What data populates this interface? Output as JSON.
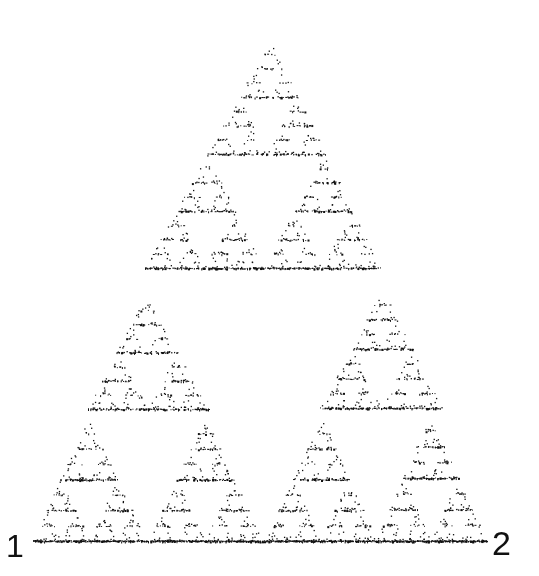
{
  "figure": {
    "type": "sierpinski-dot-fractal",
    "background": "#ffffff",
    "dot_color": "#111111",
    "labels": {
      "left_corner": "1",
      "right_corner": "2"
    },
    "triangles": [
      {
        "name": "top",
        "apex": [
          270,
          40
        ],
        "base_left": [
          145,
          268
        ],
        "base_right": [
          380,
          268
        ],
        "levels": 4,
        "density": 0.55
      },
      {
        "name": "middle-left",
        "apex": [
          145,
          296
        ],
        "base_left": [
          88,
          409
        ],
        "base_right": [
          208,
          409
        ],
        "levels": 3,
        "density": 0.6
      },
      {
        "name": "middle-right",
        "apex": [
          382,
          290
        ],
        "base_left": [
          320,
          408
        ],
        "base_right": [
          442,
          408
        ],
        "levels": 3,
        "density": 0.65
      },
      {
        "name": "bottom-1",
        "apex": [
          88,
          418
        ],
        "base_left": [
          33,
          541
        ],
        "base_right": [
          146,
          541
        ],
        "levels": 3,
        "density": 0.75
      },
      {
        "name": "bottom-2",
        "apex": [
          205,
          418
        ],
        "base_left": [
          148,
          541
        ],
        "base_right": [
          262,
          541
        ],
        "levels": 3,
        "density": 0.75
      },
      {
        "name": "bottom-3",
        "apex": [
          322,
          418
        ],
        "base_left": [
          264,
          541
        ],
        "base_right": [
          376,
          541
        ],
        "levels": 3,
        "density": 0.75
      },
      {
        "name": "bottom-4",
        "apex": [
          430,
          415
        ],
        "base_left": [
          376,
          541
        ],
        "base_right": [
          486,
          541
        ],
        "levels": 3,
        "density": 0.8
      }
    ],
    "baseline": {
      "y": 541,
      "x_start": 33,
      "x_end": 486
    }
  }
}
